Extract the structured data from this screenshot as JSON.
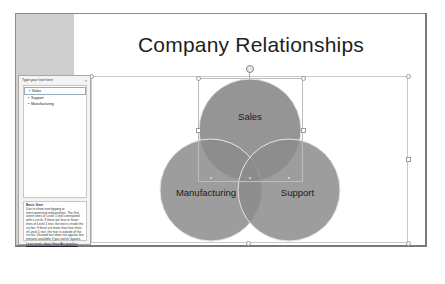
{
  "slide": {
    "title": "Company Relationships"
  },
  "text_pane": {
    "header": "Type your text here",
    "close_label": "×",
    "items": [
      {
        "bullet": "•",
        "label": "Sales"
      },
      {
        "bullet": "•",
        "label": "Support"
      },
      {
        "bullet": "•",
        "label": "Manufacturing"
      }
    ],
    "help": {
      "title": "Basic Venn",
      "body": "Use to show overlapping or interconnected relationships. The first seven lines of Level 1 text correspond with a circle. If there are four or fewer lines of Level 1 text, the text is inside the circles. If there are more than four lines of Level 1 text, the text is outside of the circles. Unused text does not appear, but remains available if you switch layouts.",
      "link": "Learn more about SmartArt graphics"
    }
  },
  "diagram": {
    "type": "basic-venn",
    "circles": [
      {
        "label": "Sales",
        "cx": 250,
        "cy": 130,
        "r": 51
      },
      {
        "label": "Manufacturing",
        "cx": 211,
        "cy": 190,
        "r": 51
      },
      {
        "label": "Support",
        "cx": 289,
        "cy": 190,
        "r": 51
      }
    ],
    "fill_color": "#8c8c8c",
    "outline_color": "#e6e6e6"
  },
  "colors": {
    "frame_border": "#8a8a8a",
    "gray_strip": "#cfcfcf",
    "title_text": "#1e1e1e"
  }
}
